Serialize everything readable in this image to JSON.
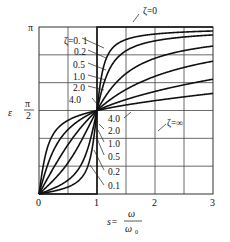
{
  "chart_data": {
    "type": "line",
    "title": "",
    "xlabel": "s = ω / ω₀",
    "xlabel_parts": {
      "lhs": "s=",
      "num": "ω",
      "den": "ω₀"
    },
    "ylabel": "ε",
    "xlim": [
      0,
      3
    ],
    "ylim": [
      0,
      3.14159
    ],
    "x_ticks": [
      {
        "value": 0,
        "label": "0"
      },
      {
        "value": 1,
        "label": "1"
      },
      {
        "value": 2,
        "label": "2"
      },
      {
        "value": 3,
        "label": "3"
      }
    ],
    "y_ticks": [
      {
        "value": 1.5708,
        "label_num": "π",
        "label_den": "2"
      },
      {
        "value": 3.14159,
        "label": "π"
      }
    ],
    "grid": {
      "x_step": 0.5,
      "y_step_fraction_of_pi": 0.16667,
      "visible": true
    },
    "formula": "ε = atan2(2ζs, 1 − s²)",
    "series": [
      {
        "name": "ζ=0",
        "label": "ζ=0",
        "type": "step",
        "x": [
          0,
          1,
          1,
          3
        ],
        "y": [
          0,
          0,
          3.14159,
          3.14159
        ]
      },
      {
        "name": "ζ=0.1",
        "label": "ζ=0. 1",
        "zeta": 0.1,
        "x": [
          0,
          0.5,
          0.9,
          1,
          1.1,
          1.5,
          2,
          3
        ],
        "y": [
          0.0,
          0.13,
          0.76,
          1.571,
          2.33,
          3.02,
          3.08,
          3.07
        ]
      },
      {
        "name": "ζ=0.2",
        "label": "0.2",
        "zeta": 0.2,
        "x": [
          0,
          0.5,
          0.9,
          1,
          1.1,
          1.5,
          2,
          3
        ],
        "y": [
          0.0,
          0.26,
          1.08,
          1.571,
          2.01,
          2.9,
          3.01,
          3.09
        ]
      },
      {
        "name": "ζ=0.5",
        "label": "0.5",
        "zeta": 0.5,
        "x": [
          0,
          0.5,
          0.9,
          1,
          1.1,
          1.5,
          2,
          3
        ],
        "y": [
          0.0,
          0.59,
          1.36,
          1.571,
          1.77,
          2.27,
          2.55,
          2.78
        ]
      },
      {
        "name": "ζ=1.0",
        "label": "1.0",
        "zeta": 1.0,
        "x": [
          0,
          0.5,
          0.9,
          1,
          1.1,
          1.5,
          2,
          3
        ],
        "y": [
          0.0,
          0.93,
          1.46,
          1.571,
          1.67,
          1.97,
          2.21,
          2.5
        ]
      },
      {
        "name": "ζ=2.0",
        "label": "2.0",
        "zeta": 2.0,
        "x": [
          0,
          0.5,
          0.9,
          1,
          1.1,
          1.5,
          2,
          3
        ],
        "y": [
          0.0,
          1.21,
          1.52,
          1.571,
          1.62,
          1.77,
          1.91,
          2.16
        ]
      },
      {
        "name": "ζ=4.0",
        "label": "4.0",
        "zeta": 4.0,
        "x": [
          0,
          0.5,
          0.9,
          1,
          1.1,
          1.5,
          2,
          3
        ],
        "y": [
          0.0,
          1.39,
          1.55,
          1.571,
          1.6,
          1.67,
          1.76,
          1.89
        ]
      },
      {
        "name": "ζ=∞",
        "label": "ζ=∞",
        "zeta": "inf",
        "x": [
          0,
          3
        ],
        "y": [
          1.571,
          1.571
        ]
      }
    ],
    "annotations": [
      "ζ=0",
      "ζ=0. 1",
      "0.2",
      "0.5",
      "1.0",
      "2.0",
      "4.0",
      "ζ=∞",
      "4.0",
      "2.0",
      "1.0",
      "0.5",
      "0.2",
      "0.1"
    ]
  },
  "labels": {
    "y_pi": "π",
    "y_half_pi_num": "π",
    "y_half_pi_den": "2",
    "y_axis": "ε",
    "x0": "0",
    "x1": "1",
    "x2": "2",
    "x3": "3",
    "x_axis_lhs": "s=",
    "x_axis_num": "ω",
    "x_axis_den": "ω",
    "x_axis_den_sub": "0",
    "zeta0": "ζ=0",
    "zetaInf": "ζ=∞",
    "upper": [
      "ζ=0. 1",
      "0.2",
      "0.5",
      "1.0",
      "2.0",
      "4.0"
    ],
    "lower": [
      "4.0",
      "2.0",
      "1.0",
      "0.5",
      "0.2",
      "0.1"
    ]
  }
}
